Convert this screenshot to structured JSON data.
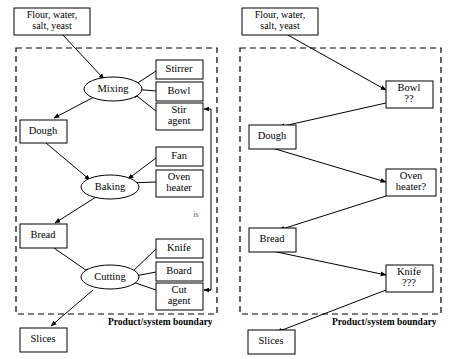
{
  "diagram": {
    "panels": [
      {
        "id": "left",
        "boundary_label": "Product/system boundary",
        "note": "is",
        "external_nodes": [
          {
            "id": "l-input",
            "label_line1": "Flour, water,",
            "label_line2": "salt, yeast",
            "shape": "box"
          },
          {
            "id": "l-slices",
            "label_line1": "Slices",
            "label_line2": "",
            "shape": "box"
          }
        ],
        "process_nodes": [
          {
            "id": "l-mixing",
            "label_line1": "Mixing",
            "label_line2": "",
            "shape": "ellipse"
          },
          {
            "id": "l-baking",
            "label_line1": "Baking",
            "label_line2": "",
            "shape": "ellipse"
          },
          {
            "id": "l-cutting",
            "label_line1": "Cutting",
            "label_line2": "",
            "shape": "ellipse"
          }
        ],
        "state_nodes": [
          {
            "id": "l-dough",
            "label_line1": "Dough",
            "label_line2": "",
            "shape": "box"
          },
          {
            "id": "l-bread",
            "label_line1": "Bread",
            "label_line2": "",
            "shape": "box"
          }
        ],
        "resource_nodes": [
          {
            "id": "l-stirrer",
            "label_line1": "Stirrer",
            "label_line2": "",
            "shape": "box"
          },
          {
            "id": "l-bowl",
            "label_line1": "Bowl",
            "label_line2": "",
            "shape": "box"
          },
          {
            "id": "l-stiragent",
            "label_line1": "Stir",
            "label_line2": "agent",
            "shape": "box"
          },
          {
            "id": "l-fan",
            "label_line1": "Fan",
            "label_line2": "",
            "shape": "box"
          },
          {
            "id": "l-ovenheater",
            "label_line1": "Oven",
            "label_line2": "heater",
            "shape": "box"
          },
          {
            "id": "l-knife",
            "label_line1": "Knife",
            "label_line2": "",
            "shape": "box"
          },
          {
            "id": "l-board",
            "label_line1": "Board",
            "label_line2": "",
            "shape": "box"
          },
          {
            "id": "l-cutagent",
            "label_line1": "Cut",
            "label_line2": "agent",
            "shape": "box"
          }
        ]
      },
      {
        "id": "right",
        "boundary_label": "Product/system boundary",
        "note": "",
        "external_nodes": [
          {
            "id": "r-input",
            "label_line1": "Flour, water,",
            "label_line2": "salt, yeast",
            "shape": "box"
          },
          {
            "id": "r-slices",
            "label_line1": "Slices",
            "label_line2": "",
            "shape": "box"
          }
        ],
        "process_nodes": [],
        "state_nodes": [
          {
            "id": "r-dough",
            "label_line1": "Dough",
            "label_line2": "",
            "shape": "box"
          },
          {
            "id": "r-bread",
            "label_line1": "Bread",
            "label_line2": "",
            "shape": "box"
          }
        ],
        "resource_nodes": [
          {
            "id": "r-bowl",
            "label_line1": "Bowl",
            "label_line2": "??",
            "shape": "box"
          },
          {
            "id": "r-ovenheater",
            "label_line1": "Oven",
            "label_line2": "heater?",
            "shape": "box"
          },
          {
            "id": "r-knife",
            "label_line1": "Knife",
            "label_line2": "???",
            "shape": "box"
          }
        ]
      }
    ]
  },
  "colors": {
    "stroke": "#000000",
    "fill": "#ffffff",
    "note": "#555555"
  }
}
